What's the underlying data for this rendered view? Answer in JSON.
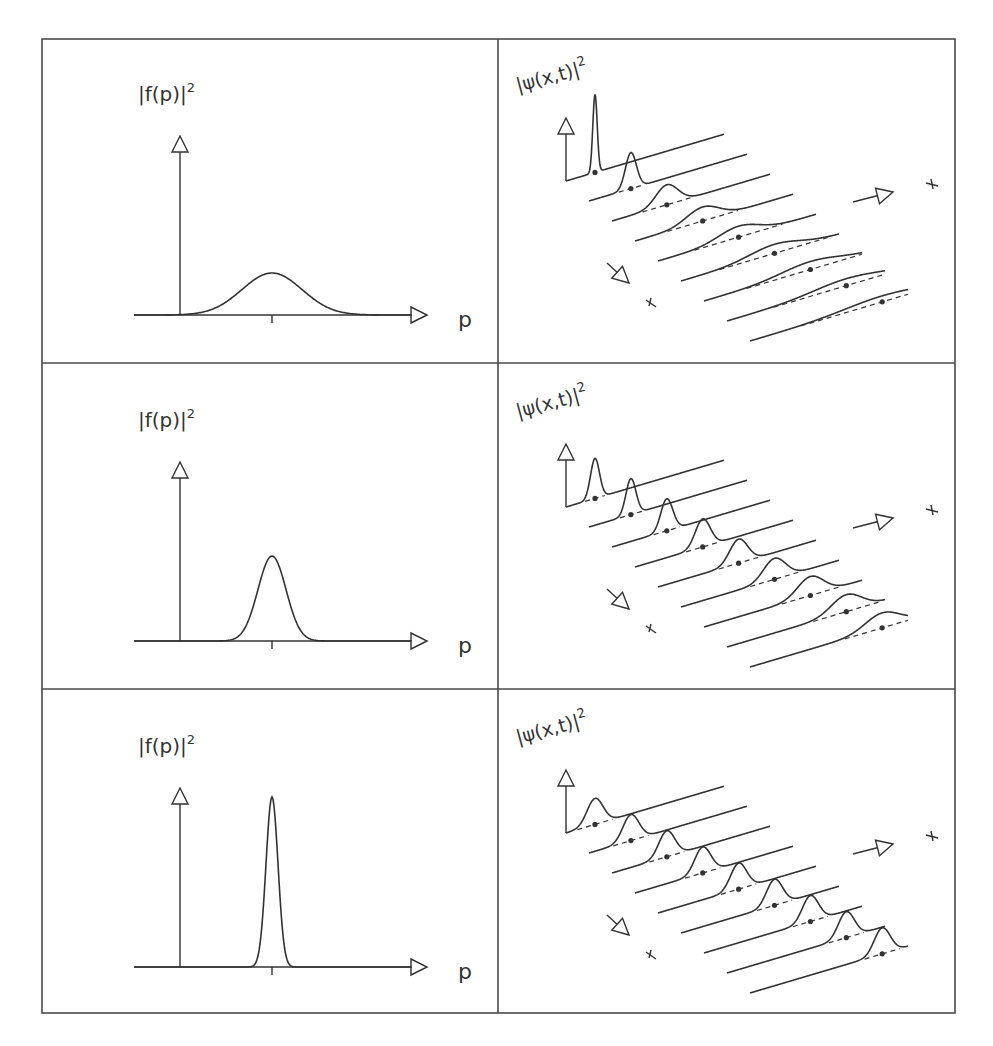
{
  "figure": {
    "width": 993,
    "height": 1046,
    "line_color": "#333333",
    "border_color": "#4a4a4a",
    "table": {
      "left": 42,
      "right": 955,
      "top": 39,
      "bottom": 1013,
      "mid_x": 498,
      "row_dividers": [
        363,
        689
      ]
    },
    "rows": [
      {
        "left_panel": {
          "label": "|f(p)|²",
          "xlabel": "p",
          "sigma": 30,
          "height": 42
        },
        "right_panel": {
          "label": "|ψ(x,t)|²",
          "packets": [
            {
              "h": 78,
              "s": 2.2
            },
            {
              "h": 36,
              "s": 5.5
            },
            {
              "h": 20,
              "s": 11
            },
            {
              "h": 14,
              "s": 16
            },
            {
              "h": 11,
              "s": 20
            },
            {
              "h": 9,
              "s": 25
            },
            {
              "h": 8,
              "s": 29
            },
            {
              "h": 7,
              "s": 33
            },
            {
              "h": 6,
              "s": 37
            }
          ]
        }
      },
      {
        "left_panel": {
          "label": "|f(p)|²",
          "xlabel": "p",
          "sigma": 14,
          "height": 85
        },
        "right_panel": {
          "label": "|ψ(x,t)|²",
          "packets": [
            {
              "h": 40,
              "s": 4.5
            },
            {
              "h": 36,
              "s": 5
            },
            {
              "h": 32,
              "s": 6
            },
            {
              "h": 28,
              "s": 7.5
            },
            {
              "h": 24,
              "s": 9
            },
            {
              "h": 21,
              "s": 11
            },
            {
              "h": 19,
              "s": 13
            },
            {
              "h": 17,
              "s": 15
            },
            {
              "h": 15,
              "s": 17
            }
          ]
        }
      },
      {
        "left_panel": {
          "label": "|f(p)|²",
          "xlabel": "p",
          "sigma": 6,
          "height": 170
        },
        "right_panel": {
          "label": "|ψ(x,t)|²",
          "packets": [
            {
              "h": 26,
              "s": 8
            },
            {
              "h": 26,
              "s": 8
            },
            {
              "h": 26,
              "s": 8
            },
            {
              "h": 26,
              "s": 8
            },
            {
              "h": 26,
              "s": 8
            },
            {
              "h": 26,
              "s": 8
            },
            {
              "h": 26,
              "s": 8
            },
            {
              "h": 26,
              "s": 8
            },
            {
              "h": 26,
              "s": 8
            }
          ]
        }
      }
    ],
    "captions": {
      "left_column": "Momentum distribution |f(p)|² with decreasing width (top to bottom)",
      "right_column": "Time evolution of wave packet probability density |ψ(x,t)|²"
    }
  }
}
